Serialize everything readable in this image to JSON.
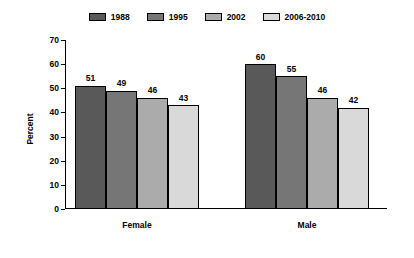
{
  "chart_data": {
    "type": "bar",
    "title": "",
    "xlabel": "",
    "ylabel": "Percent",
    "ylim": [
      0,
      70
    ],
    "yticks": [
      0,
      10,
      20,
      30,
      40,
      50,
      60,
      70
    ],
    "grid": false,
    "legend_position": "top",
    "categories": [
      "Female",
      "Male"
    ],
    "series": [
      {
        "name": "1988",
        "values": [
          51,
          49
        ],
        "color": "#595959"
      },
      {
        "name": "1995",
        "values": [
          49,
          55
        ],
        "color": "#767676"
      },
      {
        "name": "2002",
        "values": [
          46,
          46
        ],
        "color": "#ababab"
      },
      {
        "name": "2006-2010",
        "values": [
          43,
          42
        ],
        "color": "#d9d9d9"
      }
    ],
    "groups": [
      {
        "label": "Female",
        "bars": [
          {
            "series": "1988",
            "value": 51,
            "label": "51",
            "color": "#595959"
          },
          {
            "series": "1995",
            "value": 49,
            "label": "49",
            "color": "#767676"
          },
          {
            "series": "2002",
            "value": 46,
            "label": "46",
            "color": "#ababab"
          },
          {
            "series": "2006-2010",
            "value": 43,
            "label": "43",
            "color": "#d9d9d9"
          }
        ]
      },
      {
        "label": "Male",
        "bars": [
          {
            "series": "1988",
            "value": 60,
            "label": "60",
            "color": "#595959"
          },
          {
            "series": "1995",
            "value": 55,
            "label": "55",
            "color": "#767676"
          },
          {
            "series": "2002",
            "value": 46,
            "label": "46",
            "color": "#ababab"
          },
          {
            "series": "2006-2010",
            "value": 42,
            "label": "42",
            "color": "#d9d9d9"
          }
        ]
      }
    ]
  },
  "legend": {
    "items": [
      {
        "label": "1988",
        "color": "#595959"
      },
      {
        "label": "1995",
        "color": "#767676"
      },
      {
        "label": "2002",
        "color": "#ababab"
      },
      {
        "label": "2006-2010",
        "color": "#d9d9d9"
      }
    ]
  },
  "axis": {
    "y_title": "Percent",
    "y_tick_labels": [
      "70",
      "60",
      "50",
      "40",
      "30",
      "20",
      "10",
      "0"
    ],
    "x_tick_labels": [
      "Female",
      "Male"
    ]
  },
  "colors": {
    "background": "#ffffff",
    "axis": "#000000",
    "text": "#000000"
  }
}
